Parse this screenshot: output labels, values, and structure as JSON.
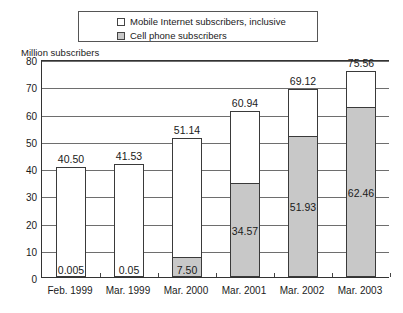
{
  "chart_data": {
    "type": "bar",
    "title": "",
    "subtitle": "",
    "xlabel": "",
    "ylabel": "Million subscribers",
    "ylim": [
      0,
      80
    ],
    "ytick_step": 10,
    "yticks": [
      "0",
      "10",
      "20",
      "30",
      "40",
      "50",
      "60",
      "70",
      "80"
    ],
    "grid": true,
    "stacked": true,
    "legend_position": "top",
    "categories": [
      "Feb. 1999",
      "Mar. 1999",
      "Mar. 2000",
      "Mar. 2001",
      "Mar. 2002",
      "Mar. 2003"
    ],
    "series": [
      {
        "name": "Cell phone subscribers",
        "color": "#c8c8c8",
        "values": [
          0.005,
          0.05,
          7.5,
          34.57,
          51.93,
          62.46
        ],
        "labels": [
          "0.005",
          "0.05",
          "7.50",
          "34.57",
          "51.93",
          "62.46"
        ]
      },
      {
        "name": "Mobile Internet subscribers, inclusive",
        "color": "#ffffff",
        "values": [
          40.5,
          41.53,
          51.14,
          60.94,
          69.12,
          75.56
        ],
        "labels": [
          "40.50",
          "41.53",
          "51.14",
          "60.94",
          "69.12",
          "75.56"
        ],
        "note": "totals (bar tops)"
      }
    ],
    "totals": [
      40.5,
      41.53,
      51.14,
      60.94,
      69.12,
      75.56
    ],
    "total_labels": [
      "40.50",
      "41.53",
      "51.14",
      "60.94",
      "69.12",
      "75.56"
    ]
  },
  "legend": {
    "items": [
      {
        "label": "Mobile Internet subscribers, inclusive",
        "swatch": "white"
      },
      {
        "label": "Cell phone subscribers",
        "swatch": "gray"
      }
    ]
  },
  "axis": {
    "y_caption": "Million subscribers"
  },
  "colors": {
    "cell_phone_fill": "#c8c8c8",
    "mobile_internet_fill": "#ffffff",
    "bar_outline": "#3a3a3a",
    "gridline": "#6e6e6e",
    "axis": "#333333"
  }
}
